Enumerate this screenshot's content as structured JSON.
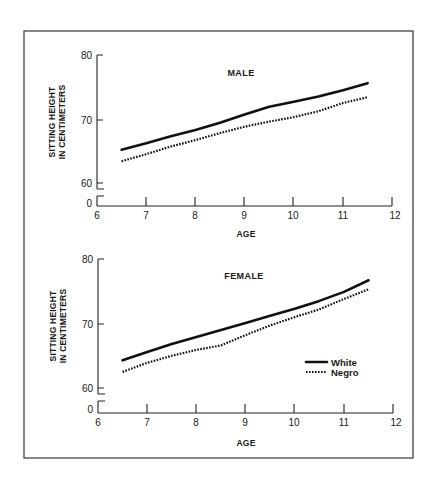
{
  "chart_data": [
    {
      "type": "line",
      "title": "MALE",
      "xlabel": "AGE",
      "ylabel": "SITTING HEIGHT IN CENTIMETERS",
      "ylabel_lines": [
        "SITTING HEIGHT",
        "IN CENTIMETERS"
      ],
      "x_ticks": [
        "6",
        "7",
        "8",
        "9",
        "10",
        "11",
        "12"
      ],
      "y_ticks": [
        "80",
        "70",
        "60",
        "0"
      ],
      "xlim": [
        6,
        12
      ],
      "ylim": [
        60,
        80
      ],
      "axis_break": true,
      "grid": false,
      "legend": false,
      "x": [
        6.5,
        7,
        7.5,
        8,
        8.5,
        9,
        9.5,
        10,
        10.5,
        11,
        11.5
      ],
      "series": [
        {
          "name": "White",
          "style": "solid",
          "values": [
            65.2,
            66.2,
            67.3,
            68.3,
            69.4,
            70.7,
            71.9,
            72.7,
            73.5,
            74.5,
            75.6
          ]
        },
        {
          "name": "Negro",
          "style": "dotted",
          "values": [
            63.4,
            64.5,
            65.7,
            66.7,
            67.8,
            68.8,
            69.6,
            70.3,
            71.2,
            72.5,
            73.4
          ]
        }
      ]
    },
    {
      "type": "line",
      "title": "FEMALE",
      "xlabel": "AGE",
      "ylabel": "SITTING HEIGHT IN CENTIMETERS",
      "ylabel_lines": [
        "SITTING HEIGHT",
        "IN CENTIMETERS"
      ],
      "x_ticks": [
        "6",
        "7",
        "8",
        "9",
        "10",
        "11",
        "12"
      ],
      "y_ticks": [
        "80",
        "70",
        "60",
        "0"
      ],
      "xlim": [
        6,
        12
      ],
      "ylim": [
        60,
        80
      ],
      "axis_break": true,
      "grid": false,
      "legend": true,
      "legend_position": "lower right",
      "x": [
        6.5,
        7,
        7.5,
        8,
        8.5,
        9,
        9.5,
        10,
        10.5,
        11,
        11.5
      ],
      "series": [
        {
          "name": "White",
          "style": "solid",
          "values": [
            64.3,
            65.6,
            66.8,
            67.9,
            69.0,
            70.1,
            71.2,
            72.3,
            73.5,
            74.9,
            76.7
          ]
        },
        {
          "name": "Negro",
          "style": "dotted",
          "values": [
            62.5,
            63.9,
            65.0,
            65.9,
            66.6,
            68.2,
            69.7,
            71.0,
            72.2,
            73.8,
            75.3
          ]
        }
      ]
    }
  ],
  "panels": {
    "male": {
      "title": "MALE",
      "xlabel": "AGE",
      "ylabel_line1": "SITTING HEIGHT",
      "ylabel_line2": "IN CENTIMETERS",
      "y80": "80",
      "y70": "70",
      "y60": "60",
      "y0": "0",
      "x6": "6",
      "x7": "7",
      "x8": "8",
      "x9": "9",
      "x10": "10",
      "x11": "11",
      "x12": "12"
    },
    "female": {
      "title": "FEMALE",
      "xlabel": "AGE",
      "ylabel_line1": "SITTING HEIGHT",
      "ylabel_line2": "IN CENTIMETERS",
      "y80": "80",
      "y70": "70",
      "y60": "60",
      "y0": "0",
      "x6": "6",
      "x7": "7",
      "x8": "8",
      "x9": "9",
      "x10": "10",
      "x11": "11",
      "x12": "12"
    }
  },
  "legend": {
    "white_label": "White",
    "negro_label": "Negro"
  }
}
